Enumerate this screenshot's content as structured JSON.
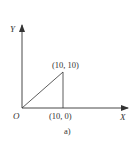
{
  "diagram": {
    "axes": {
      "x_label": "X",
      "y_label": "Y",
      "origin_label": "O"
    },
    "points": [
      {
        "label": "(10, 10)",
        "x": 10,
        "y": 10
      },
      {
        "label": "(10, 0)",
        "x": 10,
        "y": 0
      }
    ],
    "caption": "a)",
    "colors": {
      "stroke": "#333333",
      "background": "#ffffff"
    }
  }
}
